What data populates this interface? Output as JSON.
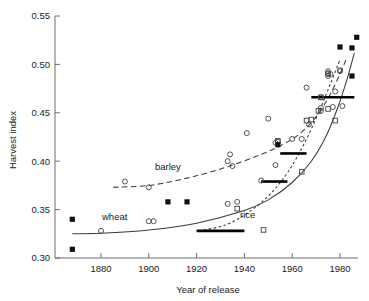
{
  "figure": {
    "title": "",
    "xlabel": "Year of release",
    "ylabel": "Harvest index"
  },
  "labels": {
    "wheat": "wheat",
    "barley": "barley",
    "rice": "rice"
  },
  "axes": {
    "x_ticks": [
      "1880",
      "1900",
      "1920",
      "1940",
      "1960",
      "1980"
    ],
    "y_ticks": [
      "0.55",
      "0.50",
      "0.45",
      "0.40",
      "0.35",
      "0.30"
    ]
  },
  "colors": {
    "line": "#3a3a3a",
    "marker_open": "#4a4a4a",
    "marker_filled": "#111111",
    "axis": "#6e6e6e",
    "background": "#ffffff"
  },
  "chart_data": {
    "type": "scatter",
    "title": "",
    "xlabel": "Year of release",
    "ylabel": "Harvest index",
    "xlim": [
      1865,
      1990
    ],
    "ylim": [
      0.3,
      0.55
    ],
    "xticks": [
      1880,
      1900,
      1920,
      1940,
      1960,
      1980
    ],
    "yticks": [
      0.3,
      0.35,
      0.4,
      0.45,
      0.5,
      0.55
    ],
    "grid": false,
    "legend": "inline annotations",
    "series": [
      {
        "name": "wheat",
        "marker": "open-circle",
        "line": "solid",
        "points": [
          [
            1880,
            0.328
          ],
          [
            1900,
            0.338
          ],
          [
            1902,
            0.338
          ],
          [
            1933,
            0.356
          ],
          [
            1937,
            0.358
          ],
          [
            1947,
            0.38
          ],
          [
            1953,
            0.396
          ],
          [
            1960,
            0.423
          ],
          [
            1966,
            0.476
          ],
          [
            1972,
            0.466
          ],
          [
            1972,
            0.452
          ],
          [
            1975,
            0.493
          ],
          [
            1975,
            0.49
          ],
          [
            1976,
            0.49
          ],
          [
            1977,
            0.456
          ],
          [
            1978,
            0.472
          ],
          [
            1980,
            0.493
          ],
          [
            1981,
            0.457
          ],
          [
            1967,
            0.438
          ]
        ],
        "fit_curve": [
          [
            1868,
            0.325
          ],
          [
            1880,
            0.3255
          ],
          [
            1900,
            0.329
          ],
          [
            1920,
            0.336
          ],
          [
            1940,
            0.349
          ],
          [
            1950,
            0.36
          ],
          [
            1960,
            0.378
          ],
          [
            1968,
            0.4
          ],
          [
            1974,
            0.425
          ],
          [
            1979,
            0.455
          ],
          [
            1983,
            0.485
          ],
          [
            1986,
            0.512
          ]
        ]
      },
      {
        "name": "barley",
        "marker": "open-circle",
        "line": "dashed",
        "points": [
          [
            1890,
            0.379
          ],
          [
            1900,
            0.373
          ],
          [
            1933,
            0.4
          ],
          [
            1934,
            0.407
          ],
          [
            1935,
            0.395
          ],
          [
            1941,
            0.429
          ],
          [
            1950,
            0.444
          ],
          [
            1953,
            0.419
          ],
          [
            1954,
            0.42
          ],
          [
            1964,
            0.423
          ],
          [
            1972,
            0.455
          ],
          [
            1975,
            0.491
          ],
          [
            1975,
            0.488
          ],
          [
            1980,
            0.494
          ]
        ],
        "fit_curve": [
          [
            1885,
            0.373
          ],
          [
            1900,
            0.375
          ],
          [
            1915,
            0.382
          ],
          [
            1930,
            0.392
          ],
          [
            1945,
            0.405
          ],
          [
            1955,
            0.416
          ],
          [
            1963,
            0.428
          ],
          [
            1970,
            0.446
          ],
          [
            1975,
            0.465
          ],
          [
            1980,
            0.49
          ],
          [
            1983,
            0.508
          ]
        ]
      },
      {
        "name": "rice",
        "marker": "open-square",
        "line": "fine-dashed",
        "points": [
          [
            1937,
            0.351
          ],
          [
            1948,
            0.329
          ],
          [
            1954,
            0.421
          ],
          [
            1964,
            0.389
          ],
          [
            1966,
            0.442
          ],
          [
            1968,
            0.443
          ],
          [
            1971,
            0.452
          ],
          [
            1972,
            0.466
          ],
          [
            1975,
            0.454
          ],
          [
            1978,
            0.442
          ]
        ],
        "fit_curve": [
          [
            1923,
            0.329
          ],
          [
            1932,
            0.334
          ],
          [
            1941,
            0.346
          ],
          [
            1950,
            0.364
          ],
          [
            1958,
            0.388
          ],
          [
            1965,
            0.418
          ],
          [
            1971,
            0.45
          ],
          [
            1976,
            0.48
          ],
          [
            1980,
            0.505
          ]
        ]
      },
      {
        "name": "filled-square-markers",
        "marker": "filled-square",
        "line": "none",
        "points": [
          [
            1868,
            0.34
          ],
          [
            1868,
            0.309
          ],
          [
            1908,
            0.358
          ],
          [
            1916,
            0.358
          ],
          [
            1954,
            0.417
          ],
          [
            1980,
            0.518
          ],
          [
            1985,
            0.517
          ],
          [
            1987,
            0.528
          ],
          [
            1985,
            0.488
          ]
        ]
      }
    ],
    "mean_bars": [
      {
        "x_start": 1920,
        "x_end": 1940,
        "value": 0.328
      },
      {
        "x_start": 1947,
        "x_end": 1958,
        "value": 0.379
      },
      {
        "x_start": 1955,
        "x_end": 1966,
        "value": 0.408
      },
      {
        "x_start": 1968,
        "x_end": 1986,
        "value": 0.466
      }
    ]
  }
}
